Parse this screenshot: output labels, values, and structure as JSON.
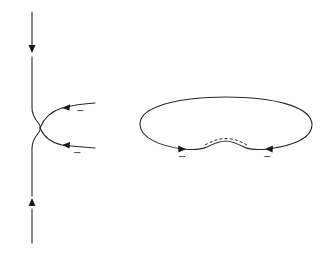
{
  "diagram": {
    "left_figure": {
      "description": "Vertical strand touching two incoming arcs at a point",
      "vertical_strand": {
        "arrows": [
          {
            "position": "top",
            "direction": "down"
          },
          {
            "position": "bottom",
            "direction": "up"
          }
        ]
      },
      "arcs": [
        {
          "position": "upper",
          "direction": "left",
          "sign": "−"
        },
        {
          "position": "lower",
          "direction": "left",
          "sign": "−"
        }
      ]
    },
    "right_figure": {
      "description": "Closed loop with a dashed arc along its lower boundary",
      "arrows": [
        {
          "position": "bottom-left",
          "direction": "right",
          "sign": "−"
        },
        {
          "position": "bottom-right",
          "direction": "left",
          "sign": "−"
        }
      ],
      "dashed_segment": true
    },
    "colors": {
      "line": "#2a2a2a",
      "background": "#ffffff"
    }
  }
}
